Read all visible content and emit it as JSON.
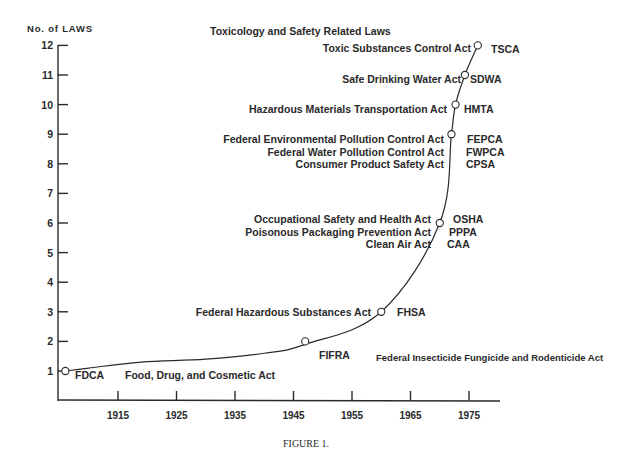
{
  "chart_data": {
    "type": "line",
    "title": "Toxicology and Safety Related Laws",
    "ylabel": "No. of LAWS",
    "xlabel": "",
    "caption": "FIGURE 1.",
    "ylim": [
      0,
      12
    ],
    "xlim": [
      1904,
      1981
    ],
    "grid": false,
    "legend": "none",
    "y_ticks": [
      1,
      2,
      3,
      4,
      5,
      6,
      7,
      8,
      9,
      10,
      11,
      12
    ],
    "x_ticks": [
      1915,
      1925,
      1935,
      1945,
      1955,
      1965,
      1975
    ],
    "points": [
      {
        "year": 1906,
        "count": 1,
        "acronyms": [
          "FDCA"
        ],
        "names": [
          "Food, Drug, and Cosmetic Act"
        ]
      },
      {
        "year": 1947,
        "count": 2,
        "acronyms": [
          "FIFRA"
        ],
        "names": [
          "Federal Insecticide Fungicide and Rodenticide Act"
        ]
      },
      {
        "year": 1960,
        "count": 3,
        "acronyms": [
          "FHSA"
        ],
        "names": [
          "Federal Hazardous Substances Act"
        ]
      },
      {
        "year": 1970,
        "count": 6,
        "acronyms": [
          "OSHA",
          "PPPA",
          "CAA"
        ],
        "names": [
          "Occupational Safety and Health Act",
          "Poisonous Packaging Prevention Act",
          "Clean Air Act"
        ]
      },
      {
        "year": 1972,
        "count": 9,
        "acronyms": [
          "FEPCA",
          "FWPCA",
          "CPSA"
        ],
        "names": [
          "Federal Environmental Pollution Control Act",
          "Federal Water Pollution Control Act",
          "Consumer Product Safety Act"
        ]
      },
      {
        "year": 1972.7,
        "count": 10,
        "acronyms": [
          "HMTA"
        ],
        "names": [
          "Hazardous Materials Transportation Act"
        ]
      },
      {
        "year": 1974.3,
        "count": 11,
        "acronyms": [
          "SDWA"
        ],
        "names": [
          "Safe Drinking Water Act"
        ]
      },
      {
        "year": 1976.5,
        "count": 12,
        "acronyms": [
          "TSCA"
        ],
        "names": [
          "Toxic Substances Control Act"
        ]
      }
    ],
    "curve_via": [
      {
        "year": 1906,
        "count": 1
      },
      {
        "year": 1910,
        "count": 1.1
      },
      {
        "year": 1919,
        "count": 1.3
      },
      {
        "year": 1930,
        "count": 1.4
      },
      {
        "year": 1940,
        "count": 1.6
      },
      {
        "year": 1947,
        "count": 1.9
      },
      {
        "year": 1960,
        "count": 3
      },
      {
        "year": 1970,
        "count": 6
      },
      {
        "year": 1972,
        "count": 9
      },
      {
        "year": 1972.7,
        "count": 10
      },
      {
        "year": 1974.3,
        "count": 11
      },
      {
        "year": 1976.5,
        "count": 12
      }
    ]
  }
}
